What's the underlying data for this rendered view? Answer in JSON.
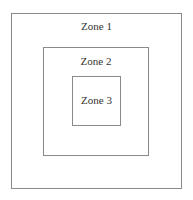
{
  "diagram": {
    "type": "nested-zones",
    "zones": [
      {
        "label": "Zone 1"
      },
      {
        "label": "Zone 2"
      },
      {
        "label": "Zone 3"
      }
    ],
    "colors": {
      "border": "#8a8a8a",
      "text": "#333333",
      "background": "#ffffff"
    }
  }
}
